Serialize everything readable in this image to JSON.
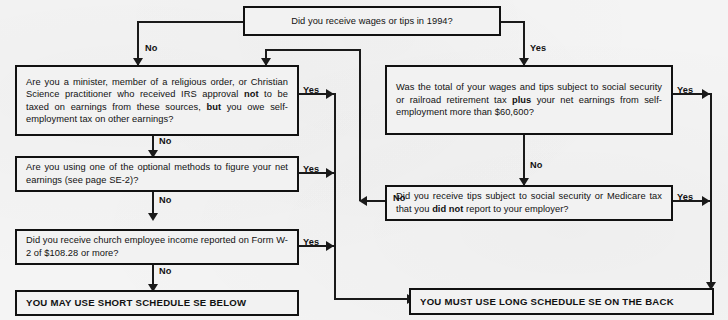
{
  "document": {
    "title": "Schedule SE (Form 1040) — Who Must File Schedule SE flowchart",
    "type": "decision-flowchart"
  },
  "nodes": {
    "q_wages": {
      "id": "q_wages",
      "kind": "decision",
      "text": "Did you receive wages or tips in 1994?"
    },
    "q_minister": {
      "id": "q_minister",
      "kind": "decision",
      "text_parts": [
        {
          "t": "Are you a minister, member of a religious order, or Christian Science practitioner who received IRS approval "
        },
        {
          "t": "not",
          "bold": true
        },
        {
          "t": " to be taxed on earnings from these sources, "
        },
        {
          "t": "but",
          "bold": true
        },
        {
          "t": " you owe self-employment tax on other earnings?"
        }
      ],
      "text": "Are you a minister, member of a religious order, or Christian Science practitioner who received IRS approval not to be taxed on earnings from these sources, but you owe self-employment tax on other earnings?"
    },
    "q_optional": {
      "id": "q_optional",
      "kind": "decision",
      "text": "Are you using one of the optional methods to figure your net earnings (see page SE-2)?"
    },
    "q_church": {
      "id": "q_church",
      "kind": "decision",
      "text": "Did you receive church employee income reported on Form W-2 of $108.28 or more?"
    },
    "q_total": {
      "id": "q_total",
      "kind": "decision",
      "text_parts": [
        {
          "t": "Was the total of your wages and tips subject to social security or railroad retirement tax "
        },
        {
          "t": "plus",
          "bold": true
        },
        {
          "t": " your net earnings from self-employment more than $60,600?"
        }
      ],
      "text": "Was the total of your wages and tips subject to social security or railroad retirement tax plus your net earnings from self-employment more than $60,600?"
    },
    "q_tips": {
      "id": "q_tips",
      "kind": "decision",
      "text_parts": [
        {
          "t": "Did you receive tips subject to social security or Medicare tax that you "
        },
        {
          "t": "did not",
          "bold": true
        },
        {
          "t": " report to your employer?"
        }
      ],
      "text": "Did you receive tips subject to social security or Medicare tax that you did not report to your employer?"
    },
    "out_short": {
      "id": "out_short",
      "kind": "terminal",
      "text": "YOU MAY USE SHORT SCHEDULE SE BELOW"
    },
    "out_long": {
      "id": "out_long",
      "kind": "terminal",
      "text": "YOU MUST USE LONG SCHEDULE SE ON THE BACK"
    }
  },
  "edges": [
    {
      "from": "q_wages",
      "to": "q_minister",
      "label": "No"
    },
    {
      "from": "q_wages",
      "to": "q_total",
      "label": "Yes"
    },
    {
      "from": "q_minister",
      "to": "q_optional",
      "label": "No"
    },
    {
      "from": "q_minister",
      "to": "out_long",
      "label": "Yes"
    },
    {
      "from": "q_optional",
      "to": "q_church",
      "label": "No"
    },
    {
      "from": "q_optional",
      "to": "out_long",
      "label": "Yes"
    },
    {
      "from": "q_church",
      "to": "out_short",
      "label": "No"
    },
    {
      "from": "q_church",
      "to": "out_long",
      "label": "Yes"
    },
    {
      "from": "q_total",
      "to": "q_tips",
      "label": "No"
    },
    {
      "from": "q_total",
      "to": "out_long",
      "label": "Yes"
    },
    {
      "from": "q_tips",
      "to": "q_minister",
      "label": "No"
    },
    {
      "from": "q_tips",
      "to": "out_long",
      "label": "Yes"
    }
  ],
  "labels": {
    "no": "No",
    "yes": "Yes"
  },
  "colors": {
    "background": "#f4f4f4",
    "box_fill": "#f2f2f2",
    "ink": "#111111",
    "line": "#1a1a1a"
  }
}
